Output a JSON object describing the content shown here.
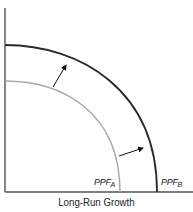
{
  "diagram": {
    "title": "Long-Run Growth",
    "curves": [
      {
        "id": "ppf-a",
        "label_main": "PPF",
        "label_sub": "A",
        "color": "#a8a8a8"
      },
      {
        "id": "ppf-b",
        "label_main": "PPF",
        "label_sub": "B",
        "color": "#2a2a2a"
      }
    ],
    "arrows": [
      {
        "id": "shift-arrow-upper",
        "direction": "outward"
      },
      {
        "id": "shift-arrow-lower",
        "direction": "outward"
      }
    ],
    "colors": {
      "axis": "#555555",
      "ppf_a": "#a8a8a8",
      "ppf_b": "#2a2a2a",
      "arrow": "#111111"
    }
  }
}
